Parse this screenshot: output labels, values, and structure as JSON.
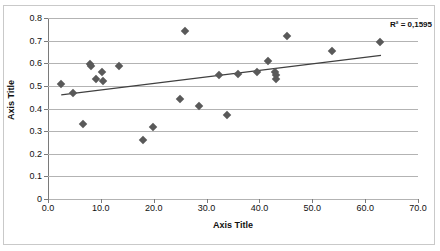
{
  "chart_data": {
    "type": "scatter",
    "title": "",
    "xlabel": "Axis Title",
    "ylabel": "Axis Title",
    "xlim": [
      0.0,
      70.0
    ],
    "ylim": [
      0.0,
      0.8
    ],
    "x_ticks": [
      "0.0",
      "10.0",
      "20.0",
      "30.0",
      "40.0",
      "50.0",
      "60.0",
      "70.0"
    ],
    "x_tick_values": [
      0,
      10,
      20,
      30,
      40,
      50,
      60,
      70
    ],
    "y_ticks": [
      "0",
      "0.1",
      "0.2",
      "0.3",
      "0.4",
      "0.5",
      "0.6",
      "0.7",
      "0.8"
    ],
    "y_tick_values": [
      0,
      0.1,
      0.2,
      0.3,
      0.4,
      0.5,
      0.6,
      0.7,
      0.8
    ],
    "grid": "horizontal",
    "legend": "none",
    "marker_shape": "diamond",
    "marker_color": "#595959",
    "gridline_color": "#b3b3b3",
    "axis_color": "#7a7a7a",
    "background_color": "#ffffff",
    "annotations": [
      {
        "name": "r-squared",
        "text": "R² = 0,1595",
        "position": "top-right"
      }
    ],
    "series": [
      {
        "name": "Series1",
        "points": [
          {
            "x": 2.5,
            "y": 0.508
          },
          {
            "x": 4.8,
            "y": 0.467
          },
          {
            "x": 6.6,
            "y": 0.33
          },
          {
            "x": 7.9,
            "y": 0.597
          },
          {
            "x": 8.1,
            "y": 0.59
          },
          {
            "x": 9.0,
            "y": 0.53
          },
          {
            "x": 10.2,
            "y": 0.56
          },
          {
            "x": 10.4,
            "y": 0.52
          },
          {
            "x": 13.4,
            "y": 0.59
          },
          {
            "x": 18.0,
            "y": 0.26
          },
          {
            "x": 19.8,
            "y": 0.32
          },
          {
            "x": 25.0,
            "y": 0.44
          },
          {
            "x": 25.9,
            "y": 0.742
          },
          {
            "x": 28.6,
            "y": 0.41
          },
          {
            "x": 32.3,
            "y": 0.549
          },
          {
            "x": 33.8,
            "y": 0.371
          },
          {
            "x": 35.9,
            "y": 0.552
          },
          {
            "x": 39.5,
            "y": 0.563
          },
          {
            "x": 41.6,
            "y": 0.608
          },
          {
            "x": 42.9,
            "y": 0.563
          },
          {
            "x": 43.1,
            "y": 0.548
          },
          {
            "x": 43.2,
            "y": 0.531
          },
          {
            "x": 45.2,
            "y": 0.722
          },
          {
            "x": 53.7,
            "y": 0.652
          },
          {
            "x": 62.9,
            "y": 0.692
          }
        ]
      }
    ],
    "trendline": {
      "name": "linear-trendline",
      "color": "#404040",
      "x_start": 2.5,
      "y_start": 0.46,
      "x_end": 63.0,
      "y_end": 0.635,
      "r_squared": "0,1595"
    }
  }
}
